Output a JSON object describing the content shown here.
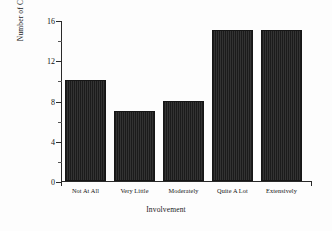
{
  "chart_data": {
    "type": "bar",
    "title": "",
    "xlabel": "Involvement",
    "ylabel": "Number of Cases",
    "categories": [
      "Not At All",
      "Very Little",
      "Moderately",
      "Quite A Lot",
      "Extensively"
    ],
    "values": [
      10,
      7,
      8,
      15,
      15
    ],
    "ylim": [
      0,
      16
    ],
    "yticks": [
      0,
      4,
      8,
      12,
      16
    ],
    "ytick_labels": [
      "0",
      "4",
      "8",
      "12",
      "16"
    ],
    "yminor_ticks": [
      2,
      6,
      10,
      14
    ],
    "grid": false,
    "legend": null,
    "bar_color": "#262626",
    "axis_color": "#2a2a2a",
    "background_color": "#fdfdfd"
  },
  "axes": {
    "y_title": "Number of Cases",
    "x_title": "Involvement"
  }
}
